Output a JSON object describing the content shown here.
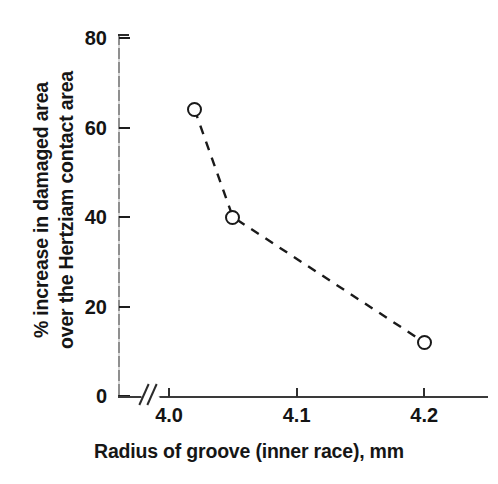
{
  "chart_data": {
    "type": "line",
    "title": "",
    "xlabel": "Radius of groove (inner race), mm",
    "ylabel_line1": "% increase in damaged area",
    "ylabel_line2": "over the Hertziam contact area",
    "x": [
      4.02,
      4.05,
      4.2
    ],
    "values": [
      64,
      40,
      12
    ],
    "series": [
      {
        "name": "% increase in damaged area",
        "x": [
          4.02,
          4.05,
          4.2
        ],
        "values": [
          64,
          40,
          12
        ]
      }
    ],
    "xlim": [
      3.96,
      4.25
    ],
    "ylim": [
      0,
      80
    ],
    "xticks": [
      4.0,
      4.1,
      4.2
    ],
    "xticklabels": [
      "4.0",
      "4.1",
      "4.2"
    ],
    "yticks": [
      0,
      20,
      40,
      60,
      80
    ],
    "yticklabels": [
      "0",
      "20",
      "40",
      "60",
      "80"
    ],
    "grid": false,
    "legend": null,
    "legend_position": "none",
    "line_style": "dashed",
    "marker_style": "open-circle",
    "x_axis_break": true,
    "x_axis_break_label": "//",
    "annotations": [],
    "colors": {
      "line": "#1a1a1a",
      "marker_edge": "#191919",
      "marker_face": "#ffffff",
      "axis": "#2f2f2f",
      "text": "#141414",
      "background": "#ffffff"
    }
  }
}
